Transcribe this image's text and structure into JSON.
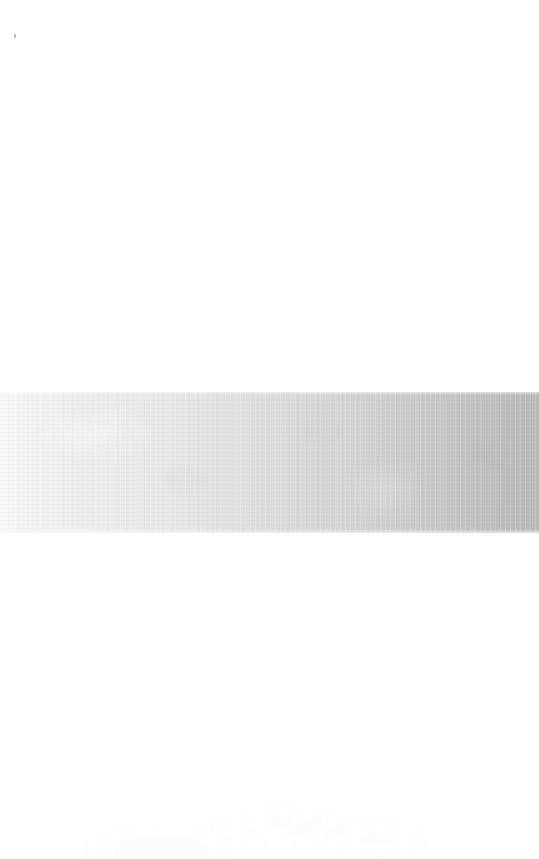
{
  "page": {
    "width_px": 539,
    "height_px": 859,
    "background_color": "#ffffff"
  },
  "content": {
    "visible_text": "",
    "text_blocks": [],
    "note": "No legible text is rendered anywhere in the image."
  },
  "band": {
    "name": "horizontal-gray-band",
    "top_px": 392,
    "bottom_px": 533,
    "height_px": 141,
    "left_px": 0,
    "right_px": 539,
    "gradient_direction": "left-to-right",
    "color_left": "#f7f7f7",
    "color_mid": "#dedede",
    "color_three_quarter": "#d2d2d2",
    "color_right": "#b8b8b8",
    "texture": "faint vertical striations with horizontal paper grain"
  },
  "artifacts": {
    "speck": {
      "name": "dust-speck",
      "x_px": 14,
      "y_px": 34,
      "color": "#787882"
    },
    "upper_mottle": "faint scanner blotches in upper region",
    "lower_mottle": "faint scanner blotches in lower region"
  },
  "colors": {
    "paper": "#ffffff",
    "band_lightest": "#f7f7f7",
    "band_darkest": "#b8b8b8",
    "speck": "#787882"
  }
}
